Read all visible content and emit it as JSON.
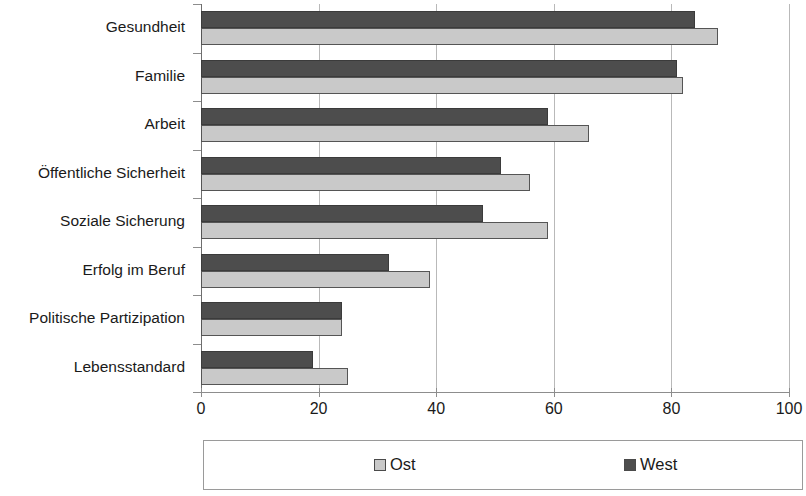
{
  "chart_data": {
    "type": "bar",
    "orientation": "horizontal",
    "title": "",
    "subtitle": "",
    "xlabel": "",
    "ylabel": "",
    "xlim": [
      0,
      100
    ],
    "xticks": [
      "0",
      "20",
      "40",
      "60",
      "80",
      "100"
    ],
    "xtick_values": [
      0,
      20,
      40,
      60,
      80,
      100
    ],
    "grid": "vertical",
    "legend_position": "bottom",
    "categories": [
      "Gesundheit",
      "Familie",
      "Arbeit",
      "Öffentliche Sicherheit",
      "Soziale Sicherung",
      "Erfolg im Beruf",
      "Politische Partizipation",
      "Lebensstandard"
    ],
    "series": [
      {
        "name": "Ost",
        "color": "#c9c9c9",
        "values": [
          88,
          82,
          66,
          56,
          59,
          39,
          24,
          25
        ]
      },
      {
        "name": "West",
        "color": "#4d4d4d",
        "values": [
          84,
          81,
          59,
          51,
          48,
          32,
          24,
          19
        ]
      }
    ]
  },
  "legend": {
    "entries": [
      {
        "label": "Ost",
        "swatch": "ost"
      },
      {
        "label": "West",
        "swatch": "west"
      }
    ]
  },
  "colors": {
    "ost": "#c9c9c9",
    "west": "#4d4d4d",
    "axis": "#8d8d8d",
    "grid": "#b9b9b9",
    "text": "#1a1a1a",
    "background": "#ffffff"
  }
}
